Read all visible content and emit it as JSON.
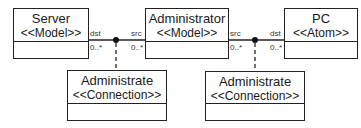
{
  "diagram": {
    "classes": [
      {
        "id": "server",
        "name": "Server",
        "stereotype": "<<Model>>"
      },
      {
        "id": "administrator",
        "name": "Administrator",
        "stereotype": "<<Model>>"
      },
      {
        "id": "pc",
        "name": "PC",
        "stereotype": "<<Atom>>"
      },
      {
        "id": "administrate1",
        "name": "Administrate",
        "stereotype": "<<Connection>>"
      },
      {
        "id": "administrate2",
        "name": "Administrate",
        "stereotype": "<<Connection>>"
      }
    ],
    "associations": [
      {
        "connection": "administrate1",
        "left": {
          "class": "server",
          "role": "dst",
          "multiplicity": "0..*"
        },
        "right": {
          "class": "administrator",
          "role": "src",
          "multiplicity": "0..*"
        }
      },
      {
        "connection": "administrate2",
        "left": {
          "class": "administrator",
          "role": "src",
          "multiplicity": "0..*"
        },
        "right": {
          "class": "pc",
          "role": "dst",
          "multiplicity": "0..*"
        }
      }
    ]
  }
}
